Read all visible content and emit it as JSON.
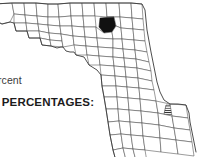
{
  "figure": {
    "type": "county-choropleth-map",
    "region": "Florida",
    "background_color": "#ffffff",
    "outline_color": "#3a3a3a",
    "county_border_color": "#4a4a4a"
  },
  "labels": {
    "caption_text": "ercent",
    "legend_heading_text": "N PERCENTAGES:"
  },
  "map": {
    "solid_county": {
      "name": "highlighted-county-solid",
      "fill_color": "#111111",
      "location": "north-central"
    },
    "hatched_county": {
      "name": "highlighted-county-hatched",
      "fill_pattern": "diagonal-hatch",
      "fill_color": "#333333",
      "location": "southeast"
    }
  }
}
